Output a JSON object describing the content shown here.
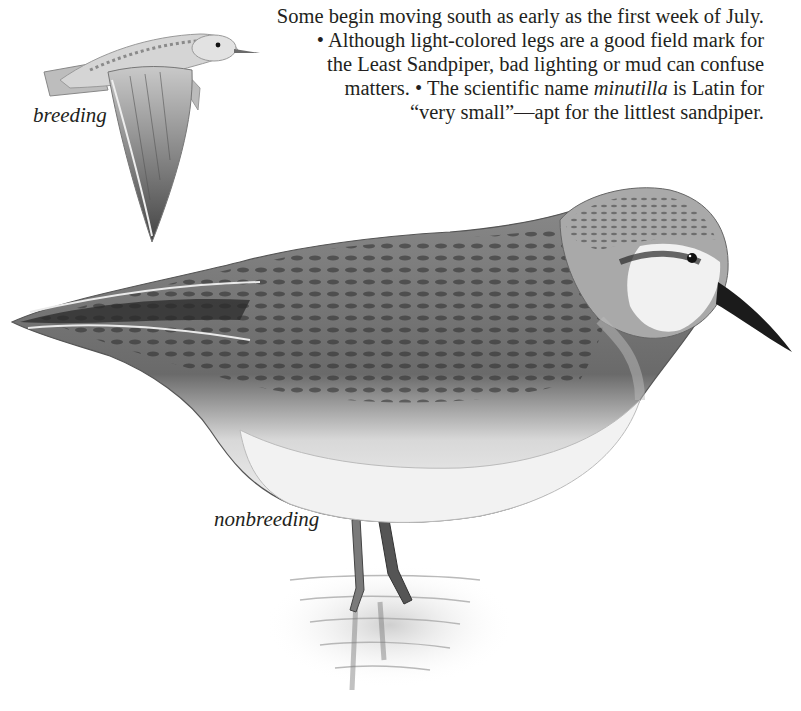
{
  "article": {
    "text_lines": [
      "Some begin moving south as early as the first week of July.",
      "• Although light-colored legs are a good field mark for",
      "the Least Sandpiper, bad lighting or mud can confuse"
    ],
    "line4_before": "matters. • The scientific name ",
    "line4_italic": "minutilla",
    "line4_after": " is Latin for",
    "line5": "“very small”—apt for the littlest sandpiper."
  },
  "illustrations": {
    "flying_bird": {
      "caption": "breeding",
      "subject": "Least Sandpiper in flight"
    },
    "standing_bird": {
      "caption": "nonbreeding",
      "subject": "Least Sandpiper standing in shallow water"
    }
  },
  "colors": {
    "text": "#231f20",
    "background": "#ffffff"
  }
}
